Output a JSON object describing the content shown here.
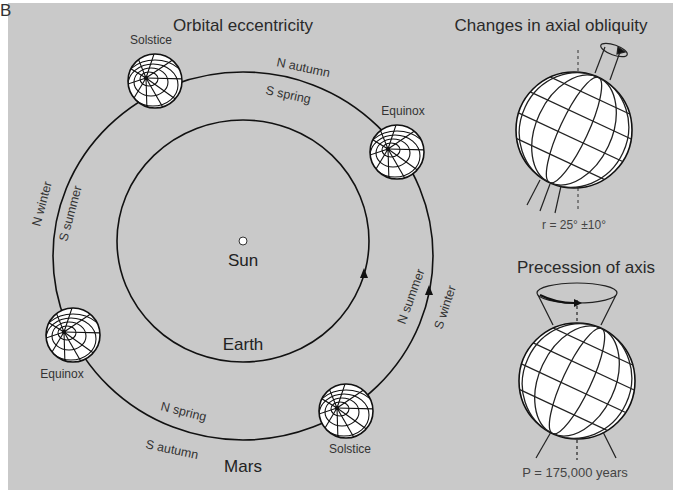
{
  "figure": {
    "panel_label": "B",
    "background_color": "#c9c9c9",
    "line_color": "#111111"
  },
  "orbital_eccentricity": {
    "title": "Orbital eccentricity",
    "sun_label": "Sun",
    "earth_label": "Earth",
    "mars_label": "Mars",
    "positions": {
      "top_solstice": "Solstice",
      "right_equinox": "Equinox",
      "left_equinox": "Equinox",
      "bottom_solstice": "Solstice"
    },
    "seasons": {
      "top_n": "N autumn",
      "top_s": "S spring",
      "left_n": "N winter",
      "left_s": "S summer",
      "right_n": "N summer",
      "right_s": "S winter",
      "bottom_n": "N spring",
      "bottom_s": "S autumn"
    }
  },
  "axial_obliquity": {
    "title": "Changes in axial obliquity",
    "formula": "r = 25° ±10°"
  },
  "precession": {
    "title": "Precession of axis",
    "formula": "P = 175,000 years"
  }
}
